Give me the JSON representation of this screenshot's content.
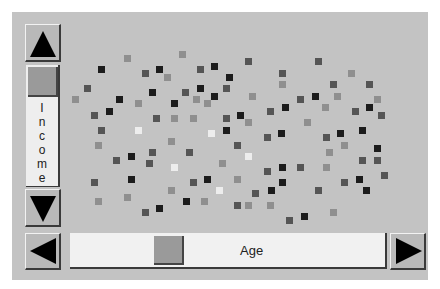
{
  "colors": {
    "background": "#c3c3c3",
    "black": "#1c1c1c",
    "dark": "#555555",
    "mid": "#8f8f8f",
    "light": "#ededed"
  },
  "vertical_slider": {
    "label": "Income",
    "label_letters": [
      "I",
      "n",
      "c",
      "o",
      "m",
      "e"
    ],
    "up_button": "up-arrow",
    "down_button": "down-arrow"
  },
  "horizontal_slider": {
    "label": "Age",
    "left_button": "left-arrow",
    "right_button": "right-arrow"
  },
  "chart_data": {
    "type": "scatter",
    "title": "",
    "xlabel": "Age",
    "ylabel": "Income",
    "grid": false,
    "legend": "none",
    "note": "pixel coordinates of square markers; shade classes k=black, d=dark gray, m=mid gray, w=near-white",
    "points": [
      [
        127,
        58,
        "m"
      ],
      [
        182,
        54,
        "m"
      ],
      [
        101,
        69,
        "k"
      ],
      [
        145,
        73,
        "d"
      ],
      [
        159,
        69,
        "k"
      ],
      [
        167,
        77,
        "m"
      ],
      [
        200,
        69,
        "d"
      ],
      [
        214,
        66,
        "k"
      ],
      [
        229,
        77,
        "k"
      ],
      [
        87,
        88,
        "d"
      ],
      [
        152,
        92,
        "k"
      ],
      [
        185,
        92,
        "d"
      ],
      [
        200,
        88,
        "k"
      ],
      [
        226,
        88,
        "d"
      ],
      [
        75,
        99,
        "m"
      ],
      [
        119,
        99,
        "k"
      ],
      [
        138,
        103,
        "m"
      ],
      [
        174,
        103,
        "k"
      ],
      [
        196,
        99,
        "m"
      ],
      [
        207,
        103,
        "m"
      ],
      [
        214,
        96,
        "k"
      ],
      [
        94,
        115,
        "d"
      ],
      [
        109,
        111,
        "k"
      ],
      [
        156,
        118,
        "d"
      ],
      [
        174,
        118,
        "m"
      ],
      [
        193,
        118,
        "m"
      ],
      [
        226,
        118,
        "d"
      ],
      [
        101,
        130,
        "d"
      ],
      [
        138,
        130,
        "w"
      ],
      [
        211,
        133,
        "w"
      ],
      [
        226,
        130,
        "k"
      ],
      [
        98,
        145,
        "m"
      ],
      [
        171,
        141,
        "m"
      ],
      [
        116,
        160,
        "d"
      ],
      [
        131,
        156,
        "k"
      ],
      [
        152,
        152,
        "d"
      ],
      [
        189,
        152,
        "d"
      ],
      [
        222,
        163,
        "m"
      ],
      [
        149,
        163,
        "d"
      ],
      [
        174,
        167,
        "w"
      ],
      [
        94,
        182,
        "d"
      ],
      [
        131,
        179,
        "k"
      ],
      [
        193,
        182,
        "d"
      ],
      [
        207,
        179,
        "k"
      ],
      [
        171,
        190,
        "m"
      ],
      [
        219,
        190,
        "w"
      ],
      [
        98,
        201,
        "m"
      ],
      [
        127,
        197,
        "m"
      ],
      [
        186,
        201,
        "k"
      ],
      [
        204,
        201,
        "m"
      ],
      [
        145,
        212,
        "d"
      ],
      [
        159,
        208,
        "k"
      ],
      [
        248,
        61,
        "d"
      ],
      [
        318,
        61,
        "d"
      ],
      [
        282,
        73,
        "d"
      ],
      [
        351,
        73,
        "m"
      ],
      [
        282,
        84,
        "m"
      ],
      [
        333,
        84,
        "d"
      ],
      [
        369,
        84,
        "d"
      ],
      [
        252,
        96,
        "m"
      ],
      [
        300,
        99,
        "d"
      ],
      [
        315,
        96,
        "k"
      ],
      [
        337,
        96,
        "m"
      ],
      [
        377,
        99,
        "m"
      ],
      [
        285,
        107,
        "k"
      ],
      [
        270,
        111,
        "d"
      ],
      [
        325,
        107,
        "m"
      ],
      [
        355,
        111,
        "d"
      ],
      [
        369,
        107,
        "k"
      ],
      [
        381,
        115,
        "d"
      ],
      [
        240,
        115,
        "k"
      ],
      [
        248,
        122,
        "m"
      ],
      [
        307,
        122,
        "m"
      ],
      [
        281,
        133,
        "k"
      ],
      [
        267,
        137,
        "d"
      ],
      [
        326,
        137,
        "d"
      ],
      [
        340,
        133,
        "k"
      ],
      [
        362,
        130,
        "k"
      ],
      [
        237,
        145,
        "d"
      ],
      [
        344,
        145,
        "m"
      ],
      [
        329,
        152,
        "m"
      ],
      [
        377,
        148,
        "k"
      ],
      [
        248,
        156,
        "w"
      ],
      [
        362,
        160,
        "d"
      ],
      [
        377,
        160,
        "d"
      ],
      [
        282,
        167,
        "k"
      ],
      [
        300,
        167,
        "d"
      ],
      [
        326,
        167,
        "m"
      ],
      [
        267,
        171,
        "d"
      ],
      [
        384,
        175,
        "d"
      ],
      [
        237,
        179,
        "m"
      ],
      [
        282,
        182,
        "k"
      ],
      [
        344,
        182,
        "d"
      ],
      [
        359,
        179,
        "k"
      ],
      [
        366,
        190,
        "k"
      ],
      [
        255,
        193,
        "d"
      ],
      [
        271,
        190,
        "k"
      ],
      [
        318,
        190,
        "d"
      ],
      [
        237,
        205,
        "d"
      ],
      [
        248,
        205,
        "m"
      ],
      [
        270,
        205,
        "m"
      ],
      [
        333,
        212,
        "m"
      ],
      [
        289,
        220,
        "d"
      ],
      [
        304,
        216,
        "k"
      ]
    ]
  }
}
